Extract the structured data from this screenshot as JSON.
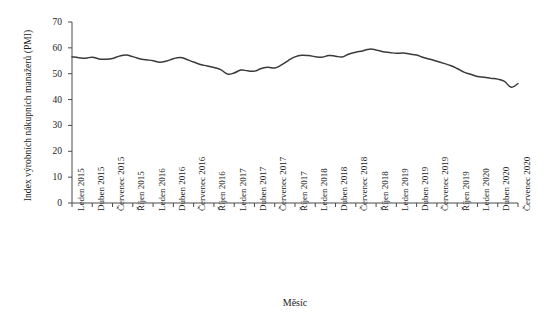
{
  "chart_data": {
    "type": "line",
    "title": "",
    "xlabel": "Měsíc",
    "ylabel": "Index výrobních nákupních manažerů (PMI)",
    "ylim": [
      0,
      70
    ],
    "yticks": [
      0,
      10,
      20,
      30,
      40,
      50,
      60,
      70
    ],
    "grid": false,
    "legend": null,
    "line_color": "#3a3a3a",
    "axis_color": "#4a4a4a",
    "tick_labels_x": [
      "Leden 2015",
      "Duben 2015",
      "Červenec 2015",
      "Říjen 2015",
      "Leden 2016",
      "Duben 2016",
      "Červenec 2016",
      "Říjen 2016",
      "Leden 2017",
      "Duben 2017",
      "Červenec 2017",
      "Říjen 2017",
      "Leden 2018",
      "Duben 2018",
      "Červenec 2018",
      "Říjen 2018",
      "Leden 2019",
      "Duben 2019",
      "Červenec 2019",
      "Říjen 2019",
      "Leden 2020",
      "Duben 2020",
      "Červenec 2020"
    ],
    "x": [
      "Leden 2015",
      "Únor 2015",
      "Březen 2015",
      "Duben 2015",
      "Květen 2015",
      "Červen 2015",
      "Červenec 2015",
      "Srpen 2015",
      "Září 2015",
      "Říjen 2015",
      "Listopad 2015",
      "Prosinec 2015",
      "Leden 2016",
      "Únor 2016",
      "Březen 2016",
      "Duben 2016",
      "Květen 2016",
      "Červen 2016",
      "Červenec 2016",
      "Srpen 2016",
      "Září 2016",
      "Říjen 2016",
      "Listopad 2016",
      "Prosinec 2016",
      "Leden 2017",
      "Únor 2017",
      "Březen 2017",
      "Duben 2017",
      "Květen 2017",
      "Červen 2017",
      "Červenec 2017",
      "Srpen 2017",
      "Září 2017",
      "Říjen 2017",
      "Listopad 2017",
      "Prosinec 2017",
      "Leden 2018",
      "Únor 2018",
      "Březen 2018",
      "Duben 2018",
      "Květen 2018",
      "Červen 2018",
      "Červenec 2018",
      "Srpen 2018",
      "Září 2018",
      "Říjen 2018",
      "Listopad 2018",
      "Prosinec 2018",
      "Leden 2019",
      "Únor 2019",
      "Březen 2019",
      "Duben 2019",
      "Květen 2019",
      "Červen 2019",
      "Červenec 2019",
      "Srpen 2019",
      "Září 2019",
      "Říjen 2019",
      "Listopad 2019",
      "Prosinec 2019",
      "Leden 2020",
      "Únor 2020",
      "Březen 2020",
      "Duben 2020",
      "Květen 2020",
      "Červen 2020",
      "Červenec 2020"
    ],
    "values": [
      56.5,
      56.2,
      56.0,
      56.4,
      55.7,
      55.6,
      55.9,
      56.8,
      57.2,
      56.6,
      55.8,
      55.4,
      55.0,
      54.4,
      54.9,
      55.8,
      56.3,
      55.5,
      54.5,
      53.6,
      53.0,
      52.4,
      51.6,
      49.9,
      50.3,
      51.4,
      51.1,
      51.0,
      52.0,
      52.5,
      52.2,
      53.4,
      55.1,
      56.5,
      57.1,
      57.0,
      56.6,
      56.4,
      57.0,
      56.8,
      56.5,
      57.6,
      58.3,
      58.8,
      59.5,
      59.2,
      58.5,
      58.2,
      57.9,
      58.0,
      57.6,
      57.2,
      56.3,
      55.6,
      54.8,
      54.0,
      53.2,
      52.0,
      50.6,
      49.8,
      48.9,
      48.6,
      48.2,
      47.9,
      47.0,
      44.8,
      46.2
    ],
    "series_note_points": 67,
    "covid_trough_value": 35.2,
    "peak_value": 59.5
  }
}
